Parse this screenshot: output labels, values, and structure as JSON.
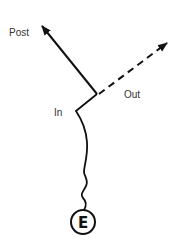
{
  "diagram": {
    "labels": {
      "post": "Post",
      "out": "Out",
      "in": "In",
      "origin": "E"
    },
    "colors": {
      "stroke": "#111111",
      "text": "#333333",
      "background": "#ffffff"
    },
    "paths": [
      {
        "name": "post-path",
        "style": "solid",
        "arrow": true
      },
      {
        "name": "out-path",
        "style": "dashed",
        "arrow": true
      },
      {
        "name": "in-path",
        "style": "wavy-solid",
        "arrow": false
      }
    ]
  }
}
